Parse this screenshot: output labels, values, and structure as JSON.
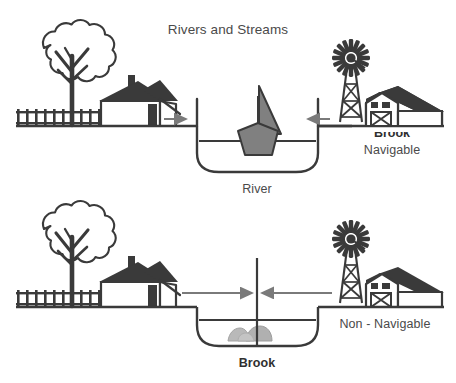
{
  "figure": {
    "title": "Rivers and Streams",
    "background_color": "#ffffff",
    "ink_color": "#3a3a3a",
    "text_color": "#4a4a4a",
    "accent_gray": "#808080",
    "arrow_color": "#7a7a7a"
  },
  "panels": [
    {
      "id": "river-panel",
      "caption": "River",
      "side_label": "Navigable",
      "occluded_label": "Brook",
      "left_scene": {
        "tree": "tree-icon",
        "fence": "fence-icon",
        "house": "house-icon"
      },
      "right_scene": {
        "windmill": "windmill-icon",
        "barn": "barn-icon"
      },
      "channel": {
        "content": "sailboat-icon",
        "left_arrow": "arrow-right-icon",
        "right_arrow": "arrow-left-icon",
        "arrow_length": "short",
        "divider": "none"
      }
    },
    {
      "id": "brook-panel",
      "caption": "Brook",
      "side_label": "Non - Navigable",
      "occluded_label": "",
      "left_scene": {
        "tree": "tree-icon",
        "fence": "fence-icon",
        "house": "house-icon"
      },
      "right_scene": {
        "windmill": "windmill-icon",
        "barn": "barn-icon"
      },
      "channel": {
        "content": "rocks-icon",
        "left_arrow": "arrow-right-icon",
        "right_arrow": "arrow-left-icon",
        "arrow_length": "long",
        "divider": "center-boundary-line"
      }
    }
  ]
}
